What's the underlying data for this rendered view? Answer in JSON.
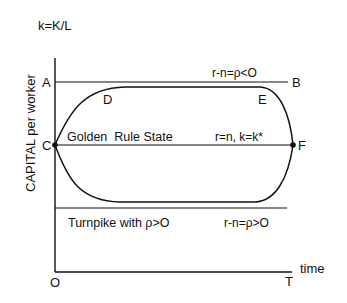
{
  "diagram": {
    "y_axis_top_label": "k=K/L",
    "y_axis_title": "CAPITAL per worker",
    "x_axis_label": "time",
    "origin_label": "O",
    "end_time_label": "T",
    "points": {
      "A": "A",
      "B": "B",
      "C": "C",
      "D": "D",
      "E": "E",
      "F": "F"
    },
    "annotations": {
      "upper_line": "r-n=ρ<O",
      "golden_rule_state": "Golden  Rule State",
      "golden_rule_condition": "r=n, k=k*",
      "turnpike": "Turnpike with ρ>O",
      "lower_line": "r-n=ρ>O"
    },
    "colors": {
      "ink": "#111111",
      "background": "#ffffff"
    }
  }
}
